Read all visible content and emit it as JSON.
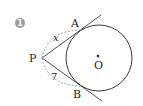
{
  "problem": {
    "number": "1",
    "marker_color": "#9a9a9a"
  },
  "diagram": {
    "circle": {
      "center_label": "O",
      "cx": 99,
      "cy": 58,
      "r": 33
    },
    "points": {
      "P": {
        "label": "P",
        "x": 42,
        "y": 58
      },
      "A": {
        "label": "A",
        "x": 82,
        "y": 30
      },
      "B": {
        "label": "B",
        "x": 82,
        "y": 86
      }
    },
    "segments": {
      "PA": {
        "label": "x"
      },
      "PB": {
        "label": "7"
      }
    },
    "line_color": "#3a3a3a",
    "dash_color": "#9a9a9a"
  }
}
